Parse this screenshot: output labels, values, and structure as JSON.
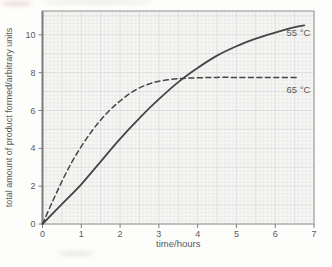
{
  "chart_data": {
    "type": "line",
    "title": "",
    "xlabel": "time/hours",
    "ylabel": "total amount of product formed/arbitrary units",
    "xlim": [
      0,
      7
    ],
    "ylim": [
      0,
      11.26
    ],
    "grid": "fine graph-paper grid, on",
    "legend_position": "labels at right end of each curve",
    "xticks": [
      {
        "v": 0,
        "label": "0"
      },
      {
        "v": 1,
        "label": "1"
      },
      {
        "v": 2,
        "label": "2"
      },
      {
        "v": 3,
        "label": "3"
      },
      {
        "v": 4,
        "label": "4"
      },
      {
        "v": 5,
        "label": "5"
      },
      {
        "v": 6,
        "label": "6"
      },
      {
        "v": 7,
        "label": "7"
      }
    ],
    "yticks": [
      {
        "v": 0,
        "label": "0"
      },
      {
        "v": 2,
        "label": "2"
      },
      {
        "v": 4,
        "label": "4"
      },
      {
        "v": 6,
        "label": "6"
      },
      {
        "v": 8,
        "label": "8"
      },
      {
        "v": 10,
        "label": "10"
      }
    ],
    "series": [
      {
        "id": "55c",
        "name": "55 °C",
        "style": "solid",
        "label_at": [
          6.6,
          9.95
        ],
        "points": [
          [
            0,
            0
          ],
          [
            0.5,
            1.05
          ],
          [
            1,
            2.1
          ],
          [
            1.5,
            3.3
          ],
          [
            2,
            4.5
          ],
          [
            2.5,
            5.6
          ],
          [
            3,
            6.6
          ],
          [
            3.5,
            7.5
          ],
          [
            4,
            8.25
          ],
          [
            4.5,
            8.9
          ],
          [
            5,
            9.4
          ],
          [
            5.5,
            9.8
          ],
          [
            6,
            10.12
          ],
          [
            6.4,
            10.35
          ],
          [
            6.75,
            10.5
          ]
        ]
      },
      {
        "id": "65c",
        "name": "65 °C",
        "style": "dashed",
        "label_at": [
          6.6,
          6.95
        ],
        "points": [
          [
            0,
            0
          ],
          [
            0.25,
            1.15
          ],
          [
            0.5,
            2.25
          ],
          [
            0.75,
            3.25
          ],
          [
            1,
            4.1
          ],
          [
            1.25,
            4.85
          ],
          [
            1.5,
            5.5
          ],
          [
            1.75,
            6.05
          ],
          [
            2,
            6.5
          ],
          [
            2.25,
            6.9
          ],
          [
            2.5,
            7.2
          ],
          [
            2.75,
            7.4
          ],
          [
            3,
            7.55
          ],
          [
            3.5,
            7.68
          ],
          [
            4,
            7.73
          ],
          [
            4.5,
            7.75
          ],
          [
            5,
            7.75
          ],
          [
            5.5,
            7.75
          ],
          [
            6,
            7.75
          ],
          [
            6.6,
            7.75
          ]
        ]
      }
    ],
    "colors": {
      "curve": "#454545",
      "axis": "#7f7f7f",
      "border": "#a8a8a8",
      "grid_minor": "#e6e6e6",
      "grid_major": "#d9d9d9",
      "plot_bg": "#f6f6f4",
      "text": "#5a5a5a"
    }
  }
}
